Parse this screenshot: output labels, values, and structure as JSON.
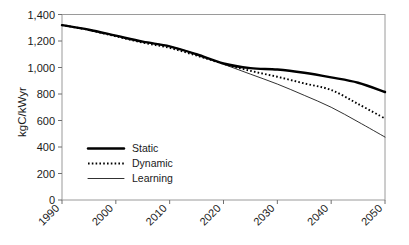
{
  "chart_data": {
    "type": "line",
    "title": "",
    "xlabel": "",
    "ylabel": "kgC/kWyr",
    "xlim": [
      1990,
      2050
    ],
    "ylim": [
      0,
      1400
    ],
    "grid": false,
    "legend_position": "inside-lower-left",
    "x_tick_labels": [
      "1990",
      "2000",
      "2010",
      "2020",
      "2030",
      "2040",
      "2050"
    ],
    "x_ticks": [
      1990,
      2000,
      2010,
      2020,
      2030,
      2040,
      2050
    ],
    "y_tick_labels": [
      "0",
      "200",
      "400",
      "600",
      "800",
      "1,000",
      "1,200",
      "1,400"
    ],
    "y_ticks": [
      0,
      200,
      400,
      600,
      800,
      1000,
      1200,
      1400
    ],
    "x": [
      1990,
      1995,
      2000,
      2005,
      2010,
      2015,
      2020,
      2025,
      2030,
      2035,
      2040,
      2045,
      2050
    ],
    "series": [
      {
        "name": "Static",
        "style": "thick-solid",
        "color": "#000000",
        "values": [
          1320,
          1285,
          1240,
          1195,
          1160,
          1100,
          1030,
          995,
          985,
          960,
          925,
          885,
          815
        ]
      },
      {
        "name": "Dynamic",
        "style": "dotted",
        "color": "#000000",
        "values": [
          1320,
          1283,
          1235,
          1188,
          1148,
          1090,
          1028,
          975,
          930,
          880,
          830,
          725,
          615
        ]
      },
      {
        "name": "Learning",
        "style": "thin-solid",
        "color": "#1a1a1a",
        "values": [
          1320,
          1285,
          1240,
          1195,
          1160,
          1100,
          1025,
          950,
          875,
          790,
          700,
          590,
          475
        ]
      }
    ]
  },
  "legend": {
    "items": [
      {
        "label": "Static"
      },
      {
        "label": "Dynamic"
      },
      {
        "label": "Learning"
      }
    ]
  }
}
